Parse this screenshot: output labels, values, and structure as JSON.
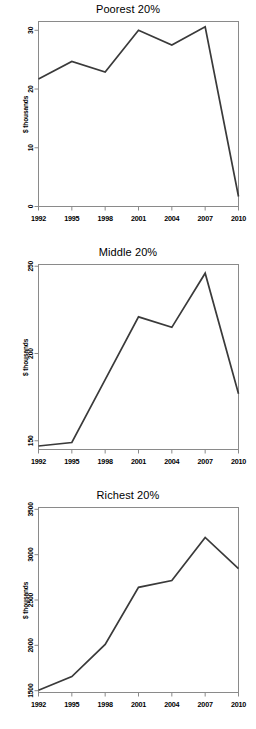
{
  "figure": {
    "background": "#ffffff",
    "line_color": "#3a3a3a",
    "axis_color": "#8a8a8a",
    "panel_count": 3
  },
  "chart_data": [
    {
      "type": "line",
      "title": "Poorest 20%",
      "xlabel": "",
      "ylabel": "$ thousands",
      "x": [
        1992,
        1995,
        1998,
        2001,
        2004,
        2007,
        2010
      ],
      "xticks": [
        "1992",
        "1995",
        "1998",
        "2001",
        "2004",
        "2007",
        "2010"
      ],
      "yticks": [
        "0",
        "10",
        "20",
        "30"
      ],
      "ytick_values": [
        0,
        10,
        20,
        30
      ],
      "values": [
        21.7,
        24.7,
        22.9,
        30.0,
        27.5,
        30.6,
        1.7
      ],
      "xlim": [
        1992,
        2010
      ],
      "ylim": [
        0,
        31.5
      ],
      "grid": false,
      "legend": "none"
    },
    {
      "type": "line",
      "title": "Middle 20%",
      "xlabel": "",
      "ylabel": "$ thousands",
      "x": [
        1992,
        1995,
        1998,
        2001,
        2004,
        2007,
        2010
      ],
      "xticks": [
        "1992",
        "1995",
        "1998",
        "2001",
        "2004",
        "2007",
        "2010"
      ],
      "yticks": [
        "150",
        "200",
        "250"
      ],
      "ytick_values": [
        150,
        200,
        250
      ],
      "values": [
        147,
        149,
        185,
        221,
        215,
        246,
        177
      ],
      "xlim": [
        1992,
        2010
      ],
      "ylim": [
        145,
        251
      ],
      "grid": false,
      "legend": "none"
    },
    {
      "type": "line",
      "title": "Richest 20%",
      "xlabel": "",
      "ylabel": "$ thousands",
      "x": [
        1992,
        1995,
        1998,
        2001,
        2004,
        2007,
        2010
      ],
      "xticks": [
        "1992",
        "1995",
        "1998",
        "2001",
        "2004",
        "2007",
        "2010"
      ],
      "yticks": [
        "1500",
        "2000",
        "2500",
        "3000",
        "3500"
      ],
      "ytick_values": [
        1500,
        2000,
        2500,
        3000,
        3500
      ],
      "values": [
        1505,
        1655,
        2010,
        2640,
        2715,
        3190,
        2845
      ],
      "xlim": [
        1992,
        2010
      ],
      "ylim": [
        1480,
        3520
      ],
      "grid": false,
      "legend": "none"
    }
  ]
}
